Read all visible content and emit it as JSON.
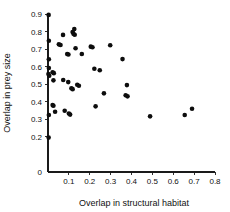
{
  "chart_data": {
    "type": "scatter",
    "title": "",
    "xlabel": "Overlap in structural habitat",
    "ylabel": "Overlap in prey size",
    "xlim": [
      0,
      0.8
    ],
    "ylim": [
      0,
      0.9
    ],
    "xticks": [
      "0",
      "0.1",
      "0.2",
      "0.3",
      "0.4",
      "0.5",
      "0.6",
      "0.7",
      "0.8"
    ],
    "xtick_values": [
      0,
      0.1,
      0.2,
      0.3,
      0.4,
      0.5,
      0.6,
      0.7,
      0.8
    ],
    "yticks": [
      "0",
      "0.2",
      "0.3",
      "0.4",
      "0.5",
      "0.6",
      "0.7",
      "0.8",
      "0.9"
    ],
    "ytick_values": [
      0,
      0.2,
      0.3,
      0.4,
      0.5,
      0.6,
      0.7,
      0.8,
      0.9
    ],
    "grid": false,
    "legend": null,
    "marker": "filled-circle",
    "marker_color": "#0d0d0d",
    "points": [
      {
        "x": 0.003,
        "y": 0.895
      },
      {
        "x": 0.004,
        "y": 0.748
      },
      {
        "x": 0.004,
        "y": 0.642
      },
      {
        "x": 0.004,
        "y": 0.592
      },
      {
        "x": 0.002,
        "y": 0.558
      },
      {
        "x": 0.006,
        "y": 0.548
      },
      {
        "x": 0.004,
        "y": 0.325
      },
      {
        "x": 0.003,
        "y": 0.196
      },
      {
        "x": 0.022,
        "y": 0.568
      },
      {
        "x": 0.028,
        "y": 0.563
      },
      {
        "x": 0.026,
        "y": 0.522
      },
      {
        "x": 0.022,
        "y": 0.381
      },
      {
        "x": 0.026,
        "y": 0.377
      },
      {
        "x": 0.034,
        "y": 0.343
      },
      {
        "x": 0.052,
        "y": 0.727
      },
      {
        "x": 0.06,
        "y": 0.723
      },
      {
        "x": 0.072,
        "y": 0.781
      },
      {
        "x": 0.073,
        "y": 0.524
      },
      {
        "x": 0.08,
        "y": 0.349
      },
      {
        "x": 0.092,
        "y": 0.672
      },
      {
        "x": 0.098,
        "y": 0.669
      },
      {
        "x": 0.097,
        "y": 0.512
      },
      {
        "x": 0.1,
        "y": 0.333
      },
      {
        "x": 0.106,
        "y": 0.327
      },
      {
        "x": 0.118,
        "y": 0.797
      },
      {
        "x": 0.122,
        "y": 0.787
      },
      {
        "x": 0.126,
        "y": 0.814
      },
      {
        "x": 0.128,
        "y": 0.782
      },
      {
        "x": 0.112,
        "y": 0.477
      },
      {
        "x": 0.118,
        "y": 0.472
      },
      {
        "x": 0.132,
        "y": 0.705
      },
      {
        "x": 0.14,
        "y": 0.497
      },
      {
        "x": 0.148,
        "y": 0.491
      },
      {
        "x": 0.162,
        "y": 0.672
      },
      {
        "x": 0.205,
        "y": 0.714
      },
      {
        "x": 0.213,
        "y": 0.711
      },
      {
        "x": 0.222,
        "y": 0.588
      },
      {
        "x": 0.228,
        "y": 0.374
      },
      {
        "x": 0.248,
        "y": 0.58
      },
      {
        "x": 0.268,
        "y": 0.448
      },
      {
        "x": 0.298,
        "y": 0.722
      },
      {
        "x": 0.357,
        "y": 0.643
      },
      {
        "x": 0.378,
        "y": 0.495
      },
      {
        "x": 0.372,
        "y": 0.437
      },
      {
        "x": 0.381,
        "y": 0.431
      },
      {
        "x": 0.489,
        "y": 0.317
      },
      {
        "x": 0.655,
        "y": 0.325
      },
      {
        "x": 0.69,
        "y": 0.36
      }
    ]
  },
  "figure": {
    "background_color": "#ffffff",
    "axis_color": "#1a1a1a"
  }
}
